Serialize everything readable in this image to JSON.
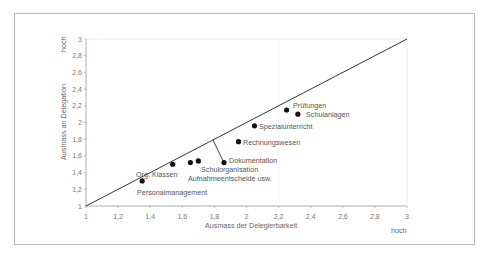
{
  "chart_data": {
    "type": "scatter",
    "title": "",
    "xlabel": "Ausmass der Delegierbarkeit",
    "ylabel": "Ausmass an Delegation",
    "x_high_label": "hoch",
    "y_high_label": "hoch",
    "xlim": [
      1,
      3
    ],
    "ylim": [
      1,
      3
    ],
    "x_ticks": [
      "1",
      "1,2",
      "1,4",
      "1,6",
      "1,8",
      "2",
      "2,2",
      "2,4",
      "2,6",
      "2,8",
      "3"
    ],
    "y_ticks": [
      "1",
      "1,2",
      "1,4",
      "1,6",
      "1,8",
      "2",
      "2,2",
      "2,4",
      "2,6",
      "2,8",
      "3"
    ],
    "grid": false,
    "reference_line": {
      "from": [
        1,
        1
      ],
      "to": [
        3,
        3
      ],
      "label": "Diagonale"
    },
    "points": [
      {
        "label": "Personalmanagement",
        "x": 1.35,
        "y": 1.3
      },
      {
        "label": "Org. Klassen",
        "x": 1.54,
        "y": 1.5
      },
      {
        "label": "Aufnahmeentscheide usw.",
        "x": 1.65,
        "y": 1.52
      },
      {
        "label": "Schulorganisation",
        "x": 1.7,
        "y": 1.54
      },
      {
        "label": "Dokumentation",
        "x": 1.86,
        "y": 1.52
      },
      {
        "label": "Rechnungswesen",
        "x": 1.95,
        "y": 1.77
      },
      {
        "label": "Spezialunterricht",
        "x": 2.05,
        "y": 1.96
      },
      {
        "label": "Prüfungen",
        "x": 2.25,
        "y": 2.15
      },
      {
        "label": "Schulanlagen",
        "x": 2.32,
        "y": 2.1
      }
    ],
    "annotation_connector": {
      "from": [
        1.79,
        1.79
      ],
      "to": [
        1.86,
        1.52
      ]
    }
  },
  "labels": {
    "personal": "Personalmanagement",
    "org": "Org. Klassen",
    "schulorg": "Schulorganisation",
    "aufnahme": "Aufnahmeentscheide usw.",
    "doku": "Dokumentation",
    "rechnung": "Rechnungswesen",
    "spezial": "Spezialunterricht",
    "pruefung": "Prüfungen",
    "schulanlagen": "Schulanlagen"
  }
}
